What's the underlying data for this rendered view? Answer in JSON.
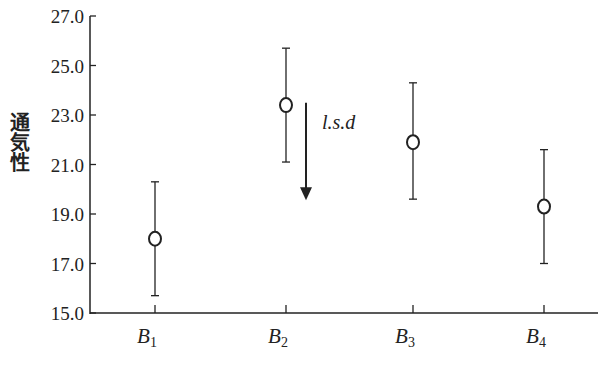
{
  "chart_data": {
    "type": "scatter",
    "subtype": "errorbar",
    "title": "",
    "xlabel": "",
    "ylabel": "通気性",
    "categories": [
      "B1",
      "B2",
      "B3",
      "B4"
    ],
    "category_display": [
      {
        "base": "B",
        "sub": "1"
      },
      {
        "base": "B",
        "sub": "2"
      },
      {
        "base": "B",
        "sub": "3"
      },
      {
        "base": "B",
        "sub": "4"
      }
    ],
    "series": [
      {
        "name": "通気性",
        "values": [
          18.0,
          23.4,
          21.9,
          19.3
        ],
        "upper": [
          20.3,
          25.7,
          24.3,
          21.6
        ],
        "lower": [
          15.7,
          21.1,
          19.6,
          17.0
        ],
        "marker": "open-circle"
      }
    ],
    "yticks": [
      "15.0",
      "17.0",
      "19.0",
      "21.0",
      "23.0",
      "25.0",
      "27.0"
    ],
    "ylim": [
      15.0,
      27.0
    ],
    "grid": false,
    "legend": null,
    "annotations": [
      {
        "type": "arrow",
        "label": "l.s.d",
        "from": 23.5,
        "to": 19.6,
        "length": 3.9
      }
    ]
  },
  "colors": {
    "ink": "#222222",
    "background": "#ffffff"
  }
}
